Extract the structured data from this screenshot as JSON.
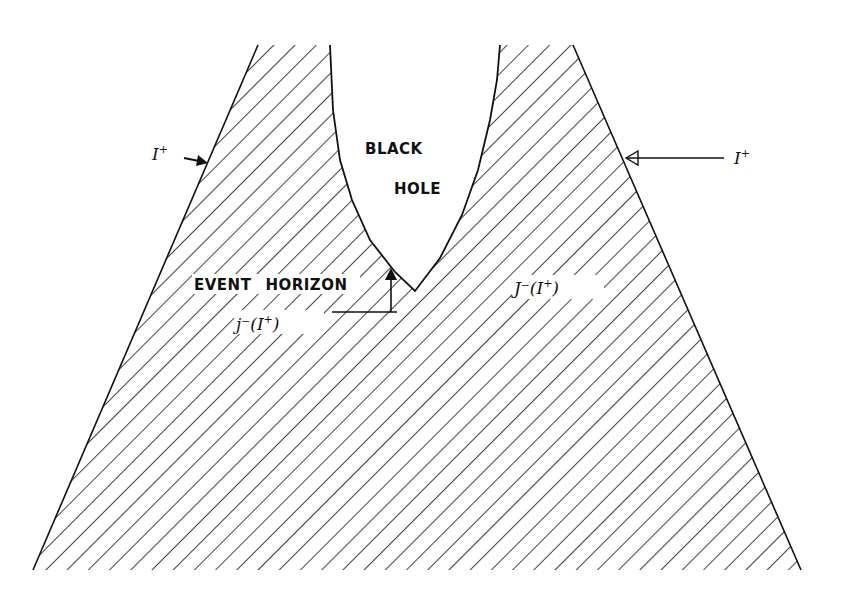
{
  "diagram": {
    "colors": {
      "ink": "#111111",
      "background": "#ffffff"
    },
    "labels": {
      "black": "BLACK",
      "hole": "HOLE",
      "event_horizon_word1": "EVENT",
      "event_horizon_word2": "HORIZON",
      "scri_plus_left": "I",
      "scri_plus_left_sup": "+",
      "scri_plus_right": "I",
      "scri_plus_right_sup": "+",
      "past_of_scri_boundary": "j⁻(I",
      "past_of_scri_boundary_sup": "+",
      "past_of_scri_boundary_close": ")",
      "past_of_scri_region": "J⁻(I",
      "past_of_scri_region_sup": "+",
      "past_of_scri_region_close": ")"
    },
    "regions": [
      {
        "name": "exterior-spacetime",
        "fill": "hatched",
        "hatch_angle": "45deg"
      },
      {
        "name": "black-hole-interior",
        "fill": "none"
      }
    ],
    "annotations": [
      {
        "name": "scri-plus-left-arrow",
        "target": "left outer boundary"
      },
      {
        "name": "scri-plus-right-arrow",
        "target": "right outer boundary"
      },
      {
        "name": "event-horizon-arrow",
        "target": "horizon boundary"
      }
    ]
  }
}
